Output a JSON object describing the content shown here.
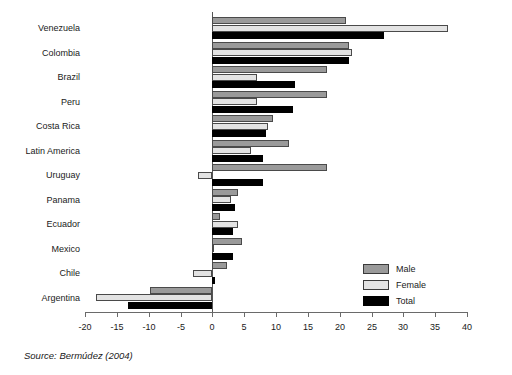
{
  "source_note": "Source: Bermúdez (2004)",
  "legend": {
    "position": "inside-right-lower",
    "items": [
      {
        "label": "Male",
        "color": "#9a9a9a"
      },
      {
        "label": "Female",
        "color": "#e3e3e3"
      },
      {
        "label": "Total",
        "color": "#000000"
      }
    ]
  },
  "chart_data": {
    "type": "bar",
    "orientation": "horizontal",
    "title": "",
    "subtitle": "",
    "xlabel": "",
    "ylabel": "",
    "xlim": [
      -20,
      40
    ],
    "xticks": [
      -20,
      -15,
      -10,
      -5,
      0,
      5,
      10,
      15,
      20,
      25,
      30,
      35,
      40
    ],
    "xtick_labels": [
      "-20",
      "-15",
      "-10",
      "-5",
      "0",
      "5",
      "10",
      "15",
      "20",
      "25",
      "30",
      "35",
      "40"
    ],
    "grid": false,
    "zero_line": true,
    "categories": [
      "Venezuela",
      "Colombia",
      "Brazil",
      "Peru",
      "Costa Rica",
      "Latin America",
      "Uruguay",
      "Panama",
      "Ecuador",
      "Mexico",
      "Chile",
      "Argentina"
    ],
    "series": [
      {
        "name": "Male",
        "color": "#9a9a9a",
        "values": [
          21.0,
          21.5,
          18.0,
          18.0,
          9.5,
          12.0,
          18.0,
          4.0,
          1.2,
          4.6,
          2.3,
          -9.8
        ]
      },
      {
        "name": "Female",
        "color": "#e3e3e3",
        "values": [
          37.0,
          22.0,
          7.0,
          7.0,
          8.8,
          6.0,
          -2.2,
          3.0,
          4.0,
          0.0,
          -3.1,
          -18.2
        ]
      },
      {
        "name": "Total",
        "color": "#000000",
        "values": [
          27.0,
          21.5,
          13.0,
          12.6,
          8.5,
          8.0,
          8.0,
          3.5,
          3.3,
          3.2,
          0.4,
          -13.2
        ]
      }
    ],
    "annotations": []
  }
}
